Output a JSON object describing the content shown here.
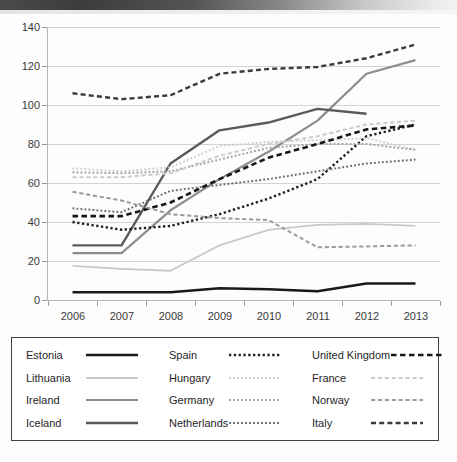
{
  "chart_data": {
    "type": "line",
    "title": "",
    "xlabel": "",
    "ylabel": "",
    "categories": [
      "2006",
      "2007",
      "2008",
      "2009",
      "2010",
      "2011",
      "2012",
      "2013"
    ],
    "x": [
      2006,
      2007,
      2008,
      2009,
      2010,
      2011,
      2012,
      2013
    ],
    "ylim": [
      0,
      140
    ],
    "yticks": [
      0,
      20,
      40,
      60,
      80,
      100,
      120,
      140
    ],
    "grid": true,
    "legend_position": "bottom",
    "series": [
      {
        "name": "Estonia",
        "style": "solid",
        "color": "#1a1a1a",
        "width": 2.6,
        "values": [
          4,
          4,
          4,
          6,
          5.5,
          4.5,
          8.5,
          8.5
        ]
      },
      {
        "name": "Lithuania",
        "style": "solid",
        "color": "#c9c9c9",
        "width": 1.8,
        "values": [
          17.5,
          16,
          15,
          28,
          36,
          38.5,
          39,
          38
        ]
      },
      {
        "name": "Ireland",
        "style": "solid",
        "color": "#8d8d8d",
        "width": 2.2,
        "values": [
          24,
          24,
          46,
          62,
          76,
          92,
          116,
          123
        ]
      },
      {
        "name": "Iceland",
        "style": "solid",
        "color": "#5a5a5a",
        "width": 2.4,
        "values": [
          28,
          28,
          70,
          87,
          91,
          98,
          95.5,
          null
        ]
      },
      {
        "name": "Spain",
        "style": "dotted",
        "color": "#1f1f1f",
        "width": 2.4,
        "values": [
          40,
          36,
          38,
          44,
          52,
          62,
          84,
          90
        ]
      },
      {
        "name": "Hungary",
        "style": "dotted",
        "color": "#cfcfcf",
        "width": 2.0,
        "values": [
          67.5,
          66,
          68,
          79,
          81,
          82,
          83,
          77
        ]
      },
      {
        "name": "Germany",
        "style": "dotted",
        "color": "#a3a3a3",
        "width": 2.0,
        "values": [
          65.5,
          65,
          66,
          72,
          78,
          80,
          80,
          77
        ]
      },
      {
        "name": "Netherlands",
        "style": "dotted",
        "color": "#6e6e6e",
        "width": 2.0,
        "values": [
          47,
          45,
          56,
          59,
          62,
          66,
          70,
          72
        ]
      },
      {
        "name": "United Kingdom",
        "style": "dashed",
        "color": "#161616",
        "width": 2.6,
        "values": [
          43,
          43,
          50,
          62,
          73,
          80,
          87.5,
          89.5
        ]
      },
      {
        "name": "France",
        "style": "dashed",
        "color": "#cccccc",
        "width": 2.0,
        "values": [
          63,
          63,
          65,
          74,
          80,
          84,
          90,
          92
        ]
      },
      {
        "name": "Norway",
        "style": "dashed",
        "color": "#9b9b9b",
        "width": 2.0,
        "values": [
          55.5,
          51,
          44,
          42,
          41,
          27,
          27.5,
          28
        ]
      },
      {
        "name": "Italy",
        "style": "dashed",
        "color": "#3b3b3b",
        "width": 2.4,
        "values": [
          106,
          103,
          105,
          116,
          118.5,
          119.5,
          124,
          131
        ]
      }
    ]
  },
  "legend": {
    "columns": [
      [
        {
          "label": "Estonia",
          "style": "solid",
          "color": "#1a1a1a",
          "width": 2.6
        },
        {
          "label": "Lithuania",
          "style": "solid",
          "color": "#c9c9c9",
          "width": 1.8
        },
        {
          "label": "Ireland",
          "style": "solid",
          "color": "#8d8d8d",
          "width": 2.2
        },
        {
          "label": "Iceland",
          "style": "solid",
          "color": "#5a5a5a",
          "width": 2.4
        }
      ],
      [
        {
          "label": "Spain",
          "style": "dotted",
          "color": "#1f1f1f",
          "width": 2.4
        },
        {
          "label": "Hungary",
          "style": "dotted",
          "color": "#cfcfcf",
          "width": 2.0
        },
        {
          "label": "Germany",
          "style": "dotted",
          "color": "#a3a3a3",
          "width": 2.0
        },
        {
          "label": "Netherlands",
          "style": "dotted",
          "color": "#6e6e6e",
          "width": 2.0
        }
      ],
      [
        {
          "label": "United Kingdom",
          "style": "dashed",
          "color": "#161616",
          "width": 2.6
        },
        {
          "label": "France",
          "style": "dashed",
          "color": "#cccccc",
          "width": 2.0
        },
        {
          "label": "Norway",
          "style": "dashed",
          "color": "#9b9b9b",
          "width": 2.0
        },
        {
          "label": "Italy",
          "style": "dashed",
          "color": "#3b3b3b",
          "width": 2.4
        }
      ]
    ]
  }
}
